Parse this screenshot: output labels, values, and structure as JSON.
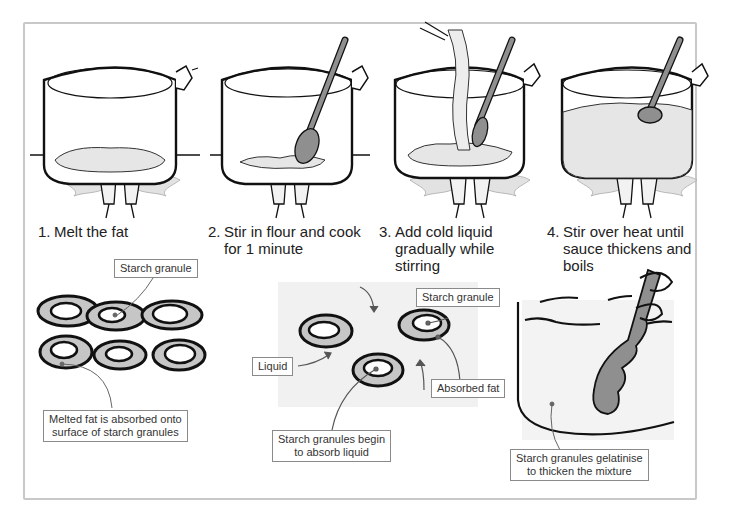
{
  "steps": [
    {
      "number": "1.",
      "line1": "Melt the fat",
      "line2": "",
      "line3": ""
    },
    {
      "number": "2.",
      "line1": "Stir in flour and cook",
      "line2": "for 1 minute",
      "line3": ""
    },
    {
      "number": "3.",
      "line1": "Add cold liquid",
      "line2": "gradually while",
      "line3": "stirring"
    },
    {
      "number": "4.",
      "line1": "Stir over heat until",
      "line2": "sauce thickens and",
      "line3": "boils"
    }
  ],
  "diagrams": {
    "fat_coating": {
      "labels": {
        "starch_granule": "Starch granule",
        "melted_fat_line1": "Melted fat is absorbed onto",
        "melted_fat_line2": "surface of starch granules"
      }
    },
    "absorption": {
      "labels": {
        "starch_granule": "Starch granule",
        "liquid": "Liquid",
        "absorbed_fat": "Absorbed fat",
        "begin_absorb_line1": "Starch granules begin",
        "begin_absorb_line2": "to absorb liquid"
      }
    },
    "gelatinisation": {
      "labels": {
        "gelatinise_line1": "Starch granules gelatinise",
        "gelatinise_line2": "to thicken the mixture"
      }
    }
  },
  "colors": {
    "frame": "#c8c8c8",
    "outline": "#111111",
    "fill_light": "#e9e9e9",
    "fill_mid": "#bdbdbd",
    "spoon": "#8f8f8f"
  }
}
